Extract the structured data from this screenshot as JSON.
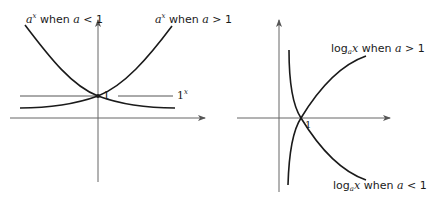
{
  "left_graph": {
    "title": "Exponential functions a^x",
    "labels": {
      "curve_a_lt_1": {
        "base": "a",
        "exp": "x",
        "text": " when ",
        "var": "a",
        "cond": " < 1"
      },
      "curve_a_gt_1": {
        "base": "a",
        "exp": "x",
        "text": " when ",
        "var": "a",
        "cond": " > 1"
      },
      "one_line": {
        "base": "1",
        "exp": "x"
      },
      "intercept": "1"
    }
  },
  "right_graph": {
    "title": "Logarithmic functions log_a x",
    "labels": {
      "curve_a_gt_1": {
        "fn": "log",
        "sub": "a",
        "var1": "x",
        "text": " when ",
        "var": "a",
        "cond": " > 1"
      },
      "curve_a_lt_1": {
        "fn": "log",
        "sub": "a",
        "var1": "x",
        "text": " when ",
        "var": "a",
        "cond": " < 1"
      },
      "intercept": "1"
    }
  },
  "colors": {
    "stroke": "#1a1a1a",
    "axis": "#555555",
    "background": "#ffffff"
  }
}
